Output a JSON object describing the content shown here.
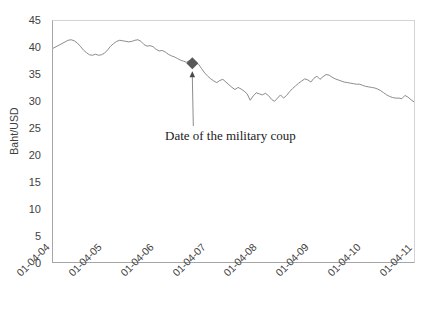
{
  "chart_data": {
    "type": "line",
    "title": "",
    "xlabel": "",
    "ylabel": "Baht/USD",
    "ylim": [
      0,
      45
    ],
    "y_ticks": [
      0,
      5,
      10,
      15,
      20,
      25,
      30,
      35,
      40,
      45
    ],
    "x_tick_labels": [
      "01-04-04",
      "01-04-05",
      "01-04-06",
      "01-04-07",
      "01-04-08",
      "01-04-09",
      "01-04-10",
      "01-04-11"
    ],
    "grid": false,
    "legend": "none",
    "line_color": "#8c8c8c",
    "marker_color": "#595959",
    "series": [
      {
        "name": "Baht/USD exchange rate",
        "values": [
          39.9,
          40.2,
          40.5,
          40.8,
          41.1,
          41.4,
          41.5,
          41.3,
          40.9,
          40.3,
          39.6,
          39.1,
          38.7,
          38.6,
          38.8,
          38.6,
          38.7,
          39.0,
          39.6,
          40.3,
          40.8,
          41.2,
          41.4,
          41.3,
          41.2,
          41.1,
          41.2,
          41.4,
          41.5,
          41.2,
          40.6,
          40.3,
          40.4,
          40.2,
          39.7,
          39.4,
          39.5,
          39.2,
          38.8,
          38.5,
          38.3,
          38.0,
          37.7,
          37.5,
          37.3,
          37.6,
          37.4,
          37.2,
          36.9,
          36.1,
          35.3,
          34.7,
          34.2,
          33.8,
          33.5,
          33.9,
          34.1,
          33.6,
          33.1,
          32.6,
          32.2,
          32.6,
          32.3,
          31.9,
          31.4,
          30.2,
          31.0,
          31.6,
          31.4,
          31.2,
          31.5,
          31.1,
          30.4,
          30.0,
          30.6,
          31.2,
          30.6,
          31.1,
          31.8,
          32.4,
          32.9,
          33.4,
          33.8,
          34.2,
          34.0,
          33.6,
          34.3,
          34.7,
          34.1,
          34.6,
          35.0,
          34.9,
          34.5,
          34.2,
          34.0,
          33.8,
          33.6,
          33.5,
          33.4,
          33.3,
          33.2,
          33.2,
          33.0,
          32.8,
          32.7,
          32.6,
          32.5,
          32.3,
          32.0,
          31.6,
          31.2,
          30.9,
          30.7,
          30.6,
          30.6,
          30.5,
          31.1,
          30.8,
          30.3,
          29.9
        ]
      }
    ],
    "annotations": [
      {
        "label": "Date of the military coup",
        "point_value": 37.0,
        "point_index": 46,
        "marker": "diamond"
      }
    ]
  },
  "axis": {
    "y_title": "Baht/USD"
  }
}
